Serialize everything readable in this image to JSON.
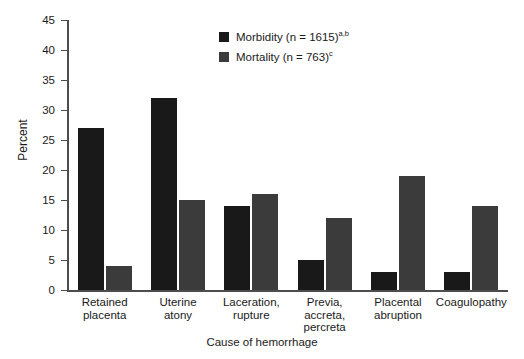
{
  "chart_data": {
    "type": "bar",
    "title": "",
    "xlabel": "Cause of hemorrhage",
    "ylabel": "Percent",
    "ylim": [
      0,
      45
    ],
    "yticks": [
      0,
      5,
      10,
      15,
      20,
      25,
      30,
      35,
      40,
      45
    ],
    "grid": false,
    "legend_position": "top-center",
    "categories": [
      "Retained\nplacenta",
      "Uterine\natony",
      "Laceration,\nrupture",
      "Previa,\naccreta,\npercreta",
      "Placental\nabruption",
      "Coagulopathy"
    ],
    "series": [
      {
        "name": "Morbidity (n = 1615)",
        "footnote": "a,b",
        "color": "#191919",
        "values": [
          27,
          32,
          14,
          5,
          3,
          3
        ]
      },
      {
        "name": "Mortality (n = 763)",
        "footnote": "c",
        "color": "#3b3b3b",
        "values": [
          4,
          15,
          16,
          12,
          19,
          14
        ]
      }
    ]
  },
  "axes": {
    "axis_color": "#4d4d4d",
    "text_color": "#1a1a1a"
  }
}
